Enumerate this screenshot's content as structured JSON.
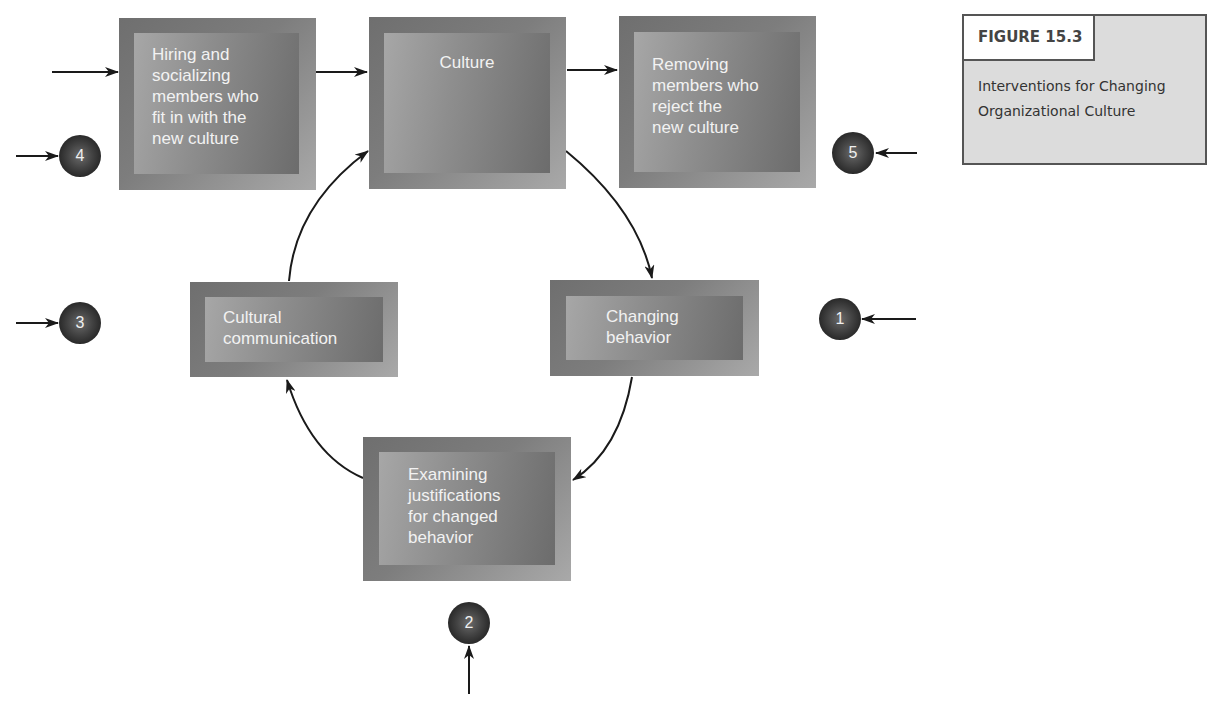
{
  "figure": {
    "label": "FIGURE 15.3",
    "caption": "Interventions for Changing\nOrganizational Culture"
  },
  "nodes": {
    "hiring": {
      "text": "Hiring and\nsocializing\nmembers who\nfit in with the\nnew culture"
    },
    "culture": {
      "text": "Culture"
    },
    "removing": {
      "text": "Removing\nmembers who\nreject the\nnew culture"
    },
    "cultural_communication": {
      "text": "Cultural\ncommunication"
    },
    "changing_behavior": {
      "text": "Changing\nbehavior"
    },
    "examining": {
      "text": "Examining\njustifications\nfor changed\nbehavior"
    }
  },
  "intervention_markers": [
    {
      "number": "1",
      "points_to": "Changing behavior"
    },
    {
      "number": "2",
      "points_to": "Examining justifications for changed behavior"
    },
    {
      "number": "3",
      "points_to": "Cultural communication"
    },
    {
      "number": "4",
      "points_to": "Hiring and socializing members who fit in with the new culture"
    },
    {
      "number": "5",
      "points_to": "Removing members who reject the new culture"
    }
  ],
  "colors": {
    "node_dark": "#6f6f6f",
    "node_light": "#a9a9a9",
    "marker": "#2a2a2a",
    "arrow": "#1a1a1a",
    "figure_box_bg": "#dcdcdc"
  }
}
